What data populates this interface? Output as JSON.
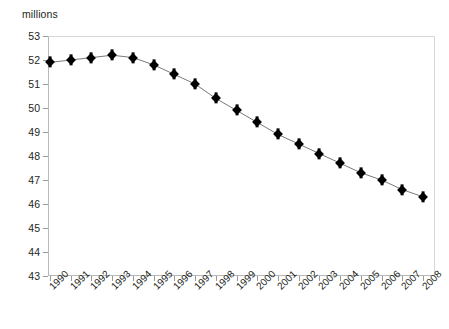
{
  "chart_data": {
    "type": "line",
    "title": "",
    "subtitle": "",
    "xlabel": "",
    "ylabel": "millions",
    "unit_label": "millions",
    "categories": [
      "1990",
      "1991",
      "1992",
      "1993",
      "1994",
      "1995",
      "1996",
      "1997",
      "1998",
      "1999",
      "2000",
      "2001",
      "2002",
      "2003",
      "2004",
      "2005",
      "2006",
      "2007",
      "2008"
    ],
    "values": [
      51.9,
      52.0,
      52.1,
      52.2,
      52.1,
      51.8,
      51.4,
      51.0,
      50.4,
      49.9,
      49.4,
      48.9,
      48.5,
      48.1,
      47.7,
      47.3,
      47.0,
      46.6,
      46.3
    ],
    "series": [
      {
        "name": "",
        "values": [
          51.9,
          52.0,
          52.1,
          52.2,
          52.1,
          51.8,
          51.4,
          51.0,
          50.4,
          49.9,
          49.4,
          48.9,
          48.5,
          48.1,
          47.7,
          47.3,
          47.0,
          46.6,
          46.3
        ]
      }
    ],
    "ylim": [
      43,
      53
    ],
    "ytick_labels": [
      "53",
      "52",
      "51",
      "50",
      "49",
      "48",
      "47",
      "46",
      "45",
      "44",
      "43"
    ],
    "ytick_values": [
      53,
      52,
      51,
      50,
      49,
      48,
      47,
      46,
      45,
      44,
      43
    ],
    "ytick_step": 1,
    "grid": false,
    "legend": false,
    "legend_position": "none",
    "annotations": [],
    "marker_style": "diamond",
    "colors": {
      "marker": "#000000",
      "line": "#7a7a7a",
      "axis": "#b9b9b9",
      "tick": "#9a9a9a",
      "text": "#231f20",
      "background": "#ffffff"
    }
  }
}
